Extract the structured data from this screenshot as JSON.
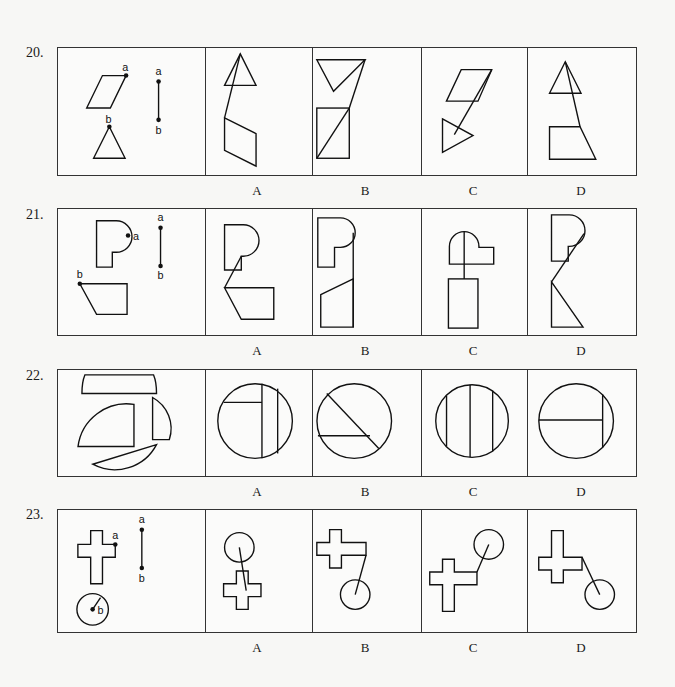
{
  "document": {
    "type": "figure-reasoning worksheet",
    "option_letters": [
      "A",
      "B",
      "C",
      "D"
    ],
    "questions": [
      {
        "number": "20.",
        "given": {
          "shapes": [
            "parallelogram with point a at top-right corner",
            "triangle with point b at apex",
            "segment a–b"
          ],
          "point_labels": [
            "a",
            "b",
            "a",
            "b"
          ]
        },
        "options": [
          {
            "label": "A",
            "description": "triangle on top, parallelogram below, joined by line from triangle apex to parallelogram corner"
          },
          {
            "label": "B",
            "description": "inverted triangle on top, rectangle with diagonal below, joined by line"
          },
          {
            "label": "C",
            "description": "parallelogram on top, triangle pointing right below, joined by line"
          },
          {
            "label": "D",
            "description": "triangle on top, trapezoid below, joined by line"
          }
        ]
      },
      {
        "number": "21.",
        "given": {
          "shapes": [
            "P-shape with point a on curved edge",
            "quadrilateral with point b at top-left corner",
            "segment a–b"
          ],
          "point_labels": [
            "a",
            "b",
            "a",
            "b"
          ]
        },
        "options": [
          {
            "label": "A",
            "description": "P-shape on top, quadrilateral below, joined at P's curve"
          },
          {
            "label": "B",
            "description": "P-shape on top, trapezoid below, joined by vertical line on right"
          },
          {
            "label": "C",
            "description": "rotated P-shape on top, rectangle below, joined by vertical line"
          },
          {
            "label": "D",
            "description": "P-shape on top, right triangle below, joined by diagonal line"
          }
        ]
      },
      {
        "number": "22.",
        "given": {
          "shapes": [
            "curved-top trapezoid strip",
            "large circular segment",
            "small quarter segment",
            "thin circular segment"
          ],
          "point_labels": []
        },
        "options": [
          {
            "label": "A",
            "description": "circle with two vertical chords and one short horizontal chord at upper-left"
          },
          {
            "label": "B",
            "description": "circle with diagonal chord and horizontal chord"
          },
          {
            "label": "C",
            "description": "circle with three vertical chords"
          },
          {
            "label": "D",
            "description": "circle with one vertical chord and one horizontal chord meeting it"
          }
        ]
      },
      {
        "number": "23.",
        "given": {
          "shapes": [
            "cross with point a on right arm",
            "circle with point b at center and radius",
            "segment a–b"
          ],
          "point_labels": [
            "a",
            "b",
            "a",
            "b"
          ]
        },
        "options": [
          {
            "label": "A",
            "description": "circle on top, cross below, line through cross"
          },
          {
            "label": "B",
            "description": "sideways cross on top, circle below right, joined by line"
          },
          {
            "label": "C",
            "description": "cross lower-left, circle upper-right, joined by line"
          },
          {
            "label": "D",
            "description": "sideways cross upper-left, circle lower-right, joined by line"
          }
        ]
      }
    ]
  }
}
